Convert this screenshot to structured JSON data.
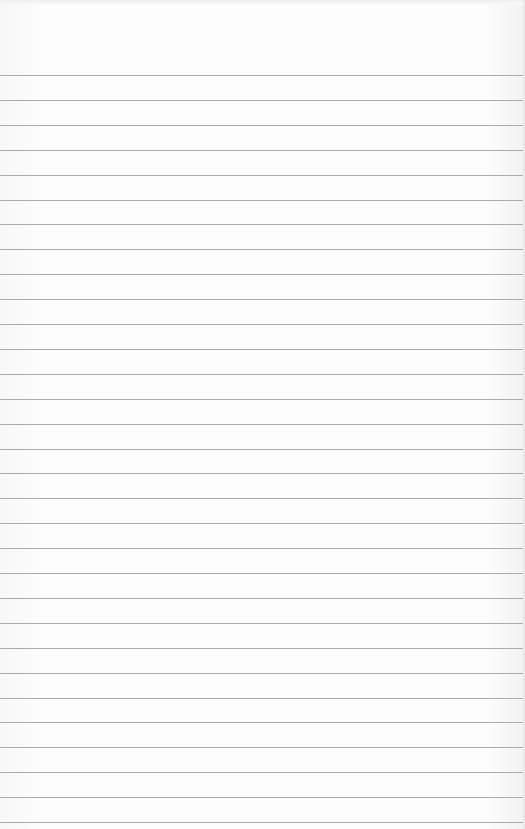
{
  "page": {
    "type": "lined-notepad-paper",
    "background_color": "#fbfbfb",
    "rule_color": "#9c9c9c"
  },
  "rules": {
    "count": 31,
    "first_y": 75,
    "spacing": 24.9
  },
  "content": {
    "text": ""
  }
}
